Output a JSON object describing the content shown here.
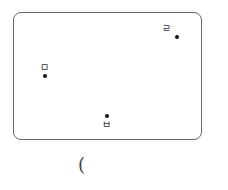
{
  "diagram": {
    "points": [
      {
        "label": "ㄹ",
        "x": 177,
        "y": 37
      },
      {
        "label": "ㅁ",
        "x": 45,
        "y": 76
      },
      {
        "label": "ㅂ",
        "x": 107,
        "y": 116
      }
    ],
    "footer_text": "("
  }
}
